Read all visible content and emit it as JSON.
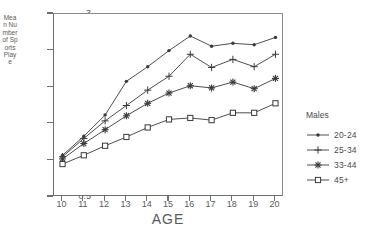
{
  "chart_data": {
    "type": "line",
    "title": "",
    "xlabel": "AGE",
    "ylabel": "Mean Number of Sports Played",
    "x": [
      10,
      11,
      12,
      13,
      14,
      15,
      16,
      17,
      18,
      19,
      20
    ],
    "xlim": [
      9.6,
      20.4
    ],
    "ylim": [
      0.5,
      3
    ],
    "yticks": [
      0.5,
      1,
      1.5,
      2,
      2.5,
      3
    ],
    "xticks": [
      10,
      11,
      12,
      13,
      14,
      15,
      16,
      17,
      18,
      19,
      20
    ],
    "grid": false,
    "legend_position": "right",
    "legend_title": "Males",
    "series": [
      {
        "name": "20-24",
        "marker": "filled-dot",
        "values": [
          1.07,
          1.33,
          1.62,
          2.08,
          2.28,
          2.5,
          2.7,
          2.56,
          2.6,
          2.58,
          2.68
        ]
      },
      {
        "name": "25-34",
        "marker": "plus",
        "values": [
          1.05,
          1.3,
          1.54,
          1.75,
          1.96,
          2.15,
          2.45,
          2.27,
          2.38,
          2.28,
          2.45
        ]
      },
      {
        "name": "33-44",
        "marker": "asterisk",
        "values": [
          1.02,
          1.23,
          1.42,
          1.61,
          1.78,
          1.92,
          2.02,
          1.99,
          2.07,
          1.98,
          2.12
        ]
      },
      {
        "name": "45+",
        "marker": "open-square",
        "values": [
          0.95,
          1.07,
          1.2,
          1.32,
          1.45,
          1.56,
          1.58,
          1.55,
          1.65,
          1.65,
          1.78
        ]
      }
    ]
  },
  "axis": {
    "ytitle_text": "Mean Number of Sports Playe",
    "xtitle_text": "AGE",
    "ytick_labels": [
      "3",
      "2.5",
      "2",
      "1.5",
      "1",
      "0.5"
    ],
    "xtick_labels": [
      "10",
      "11",
      "12",
      "13",
      "14",
      "15",
      "16",
      "17",
      "18",
      "19",
      "20"
    ]
  },
  "legend": {
    "title": "Males",
    "items": [
      {
        "label": "20-24"
      },
      {
        "label": "25-34"
      },
      {
        "label": "33-44"
      },
      {
        "label": "45+"
      }
    ]
  },
  "colors": {
    "line": "#3a3a3a",
    "axis": "#6e6e6e",
    "text": "#4a4a4a",
    "background": "#ffffff"
  }
}
